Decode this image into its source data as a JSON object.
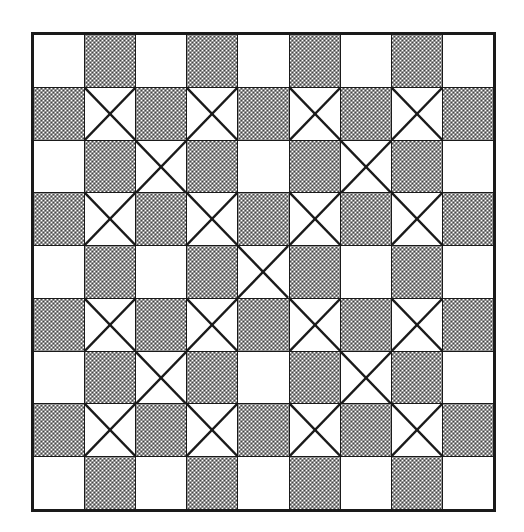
{
  "figure": {
    "type": "grid-pattern-diagram",
    "rows": 9,
    "columns": 9,
    "colors": {
      "ink": "#1a1a1a",
      "light_cell": "#ffffff",
      "shaded_cell_effective": "#808080",
      "background": "#ffffff"
    },
    "legend": {
      "shade_names": [
        "white",
        "gray"
      ],
      "mark_names": [
        "none",
        "cross"
      ]
    }
  },
  "chart_data": {
    "type": "heatmap",
    "xlabel": "",
    "ylabel": "",
    "grid": true,
    "legend_position": "none",
    "categories_x": [
      "0",
      "1",
      "2",
      "3",
      "4",
      "5",
      "6",
      "7",
      "8"
    ],
    "categories_y": [
      "0",
      "1",
      "2",
      "3",
      "4",
      "5",
      "6",
      "7",
      "8"
    ],
    "shade": [
      [
        "white",
        "gray",
        "white",
        "gray",
        "white",
        "gray",
        "white",
        "gray",
        "white"
      ],
      [
        "gray",
        "white",
        "gray",
        "white",
        "gray",
        "white",
        "gray",
        "white",
        "gray"
      ],
      [
        "white",
        "gray",
        "white",
        "gray",
        "white",
        "gray",
        "white",
        "gray",
        "white"
      ],
      [
        "gray",
        "white",
        "gray",
        "white",
        "gray",
        "white",
        "gray",
        "white",
        "gray"
      ],
      [
        "white",
        "gray",
        "white",
        "gray",
        "white",
        "gray",
        "white",
        "gray",
        "white"
      ],
      [
        "gray",
        "white",
        "gray",
        "white",
        "gray",
        "white",
        "gray",
        "white",
        "gray"
      ],
      [
        "white",
        "gray",
        "white",
        "gray",
        "white",
        "gray",
        "white",
        "gray",
        "white"
      ],
      [
        "gray",
        "white",
        "gray",
        "white",
        "gray",
        "white",
        "gray",
        "white",
        "gray"
      ],
      [
        "white",
        "gray",
        "white",
        "gray",
        "white",
        "gray",
        "white",
        "gray",
        "white"
      ]
    ],
    "cross": [
      [
        0,
        0,
        0,
        0,
        0,
        0,
        0,
        0,
        0
      ],
      [
        0,
        1,
        0,
        1,
        0,
        1,
        0,
        1,
        0
      ],
      [
        0,
        0,
        1,
        0,
        0,
        0,
        1,
        0,
        0
      ],
      [
        0,
        1,
        0,
        1,
        0,
        1,
        0,
        1,
        0
      ],
      [
        0,
        0,
        0,
        0,
        1,
        0,
        0,
        0,
        0
      ],
      [
        0,
        1,
        0,
        1,
        0,
        1,
        0,
        1,
        0
      ],
      [
        0,
        0,
        1,
        0,
        0,
        0,
        1,
        0,
        0
      ],
      [
        0,
        1,
        0,
        1,
        0,
        1,
        0,
        1,
        0
      ],
      [
        0,
        0,
        0,
        0,
        0,
        0,
        0,
        0,
        0
      ]
    ],
    "cross_count": 21,
    "gray_count": 40,
    "white_count": 41
  }
}
